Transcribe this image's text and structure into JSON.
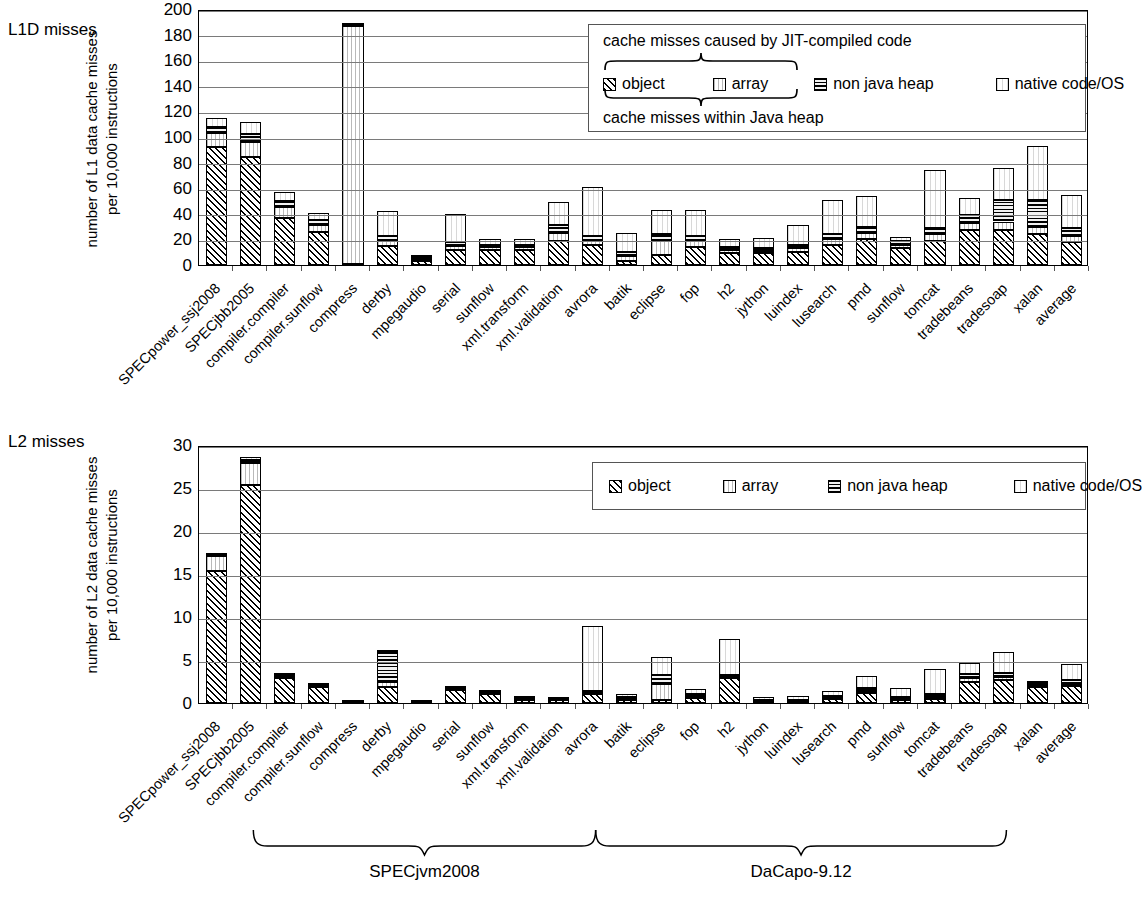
{
  "figure": {
    "panels": [
      {
        "side_title": "L1D misses",
        "ylabel_line1": "number of L1 data cache misses",
        "ylabel_line2": "per 10,000 instructions"
      },
      {
        "side_title": "L2 misses",
        "ylabel_line1": "number of L2 data cache misses",
        "ylabel_line2": "per 10,000 instructions"
      }
    ],
    "legend": {
      "top_caption": "cache misses caused by JIT-compiled code",
      "bottom_caption": "cache misses within Java heap",
      "entries": [
        {
          "label": "object",
          "swatch": "hatch-diagonal-swatch"
        },
        {
          "label": "array",
          "swatch": "vertical-light-swatch"
        },
        {
          "label": "non java heap",
          "swatch": "horizontal-dense-swatch"
        },
        {
          "label": "native code/OS",
          "swatch": "plain-light-swatch"
        }
      ]
    },
    "groups": [
      {
        "label": "SPECjvm2008",
        "start": 2,
        "end": 11
      },
      {
        "label": "DaCapo-9.12",
        "start": 12,
        "end": 23
      }
    ]
  },
  "chart_data": [
    {
      "type": "bar",
      "stacked": true,
      "title": "L1D misses",
      "xlabel": "",
      "ylabel": "number of L1 data cache misses per 10,000 instructions",
      "ylim": [
        0,
        200
      ],
      "yticks": [
        0,
        20,
        40,
        60,
        80,
        100,
        120,
        140,
        160,
        180,
        200
      ],
      "grid": true,
      "legend_position": "upper-right",
      "categories": [
        "SPECpower_ssj2008",
        "SPECjbb2005",
        "compiler.compiler",
        "compiler.sunflow",
        "compress",
        "derby",
        "mpegaudio",
        "serial",
        "sunflow",
        "xml.transform",
        "xml.validation",
        "avrora",
        "batik",
        "eclipse",
        "fop",
        "h2",
        "jython",
        "luindex",
        "lusearch",
        "pmd",
        "sunflow",
        "tomcat",
        "tradebeans",
        "tradesoap",
        "xalan",
        "average"
      ],
      "series": [
        {
          "name": "object",
          "values": [
            92,
            84,
            37,
            26,
            0.5,
            15,
            3,
            12,
            12,
            12,
            19,
            16,
            3,
            8,
            14,
            9,
            9,
            10,
            16,
            20,
            13,
            19,
            27,
            27,
            24,
            18
          ]
        },
        {
          "name": "array",
          "values": [
            11,
            12,
            8,
            5,
            186,
            4,
            2,
            3,
            2,
            2,
            6,
            3,
            4,
            11,
            5,
            3,
            2,
            3,
            4,
            5,
            3,
            5,
            6,
            7,
            6,
            5
          ]
        },
        {
          "name": "non java heap",
          "values": [
            5,
            6,
            5,
            4,
            1,
            4,
            1,
            3,
            2,
            2,
            6,
            4,
            3,
            5,
            4,
            2,
            2,
            3,
            4,
            5,
            3,
            5,
            6,
            17,
            21,
            6
          ]
        },
        {
          "name": "native code/OS",
          "values": [
            7,
            10,
            7,
            6,
            0.5,
            19,
            1,
            22,
            4,
            4,
            18,
            38,
            15,
            19,
            20,
            6,
            8,
            15,
            27,
            24,
            3,
            45,
            13,
            25,
            42,
            26
          ]
        }
      ]
    },
    {
      "type": "bar",
      "stacked": true,
      "title": "L2 misses",
      "xlabel": "",
      "ylabel": "number of L2 data cache misses per 10,000 instructions",
      "ylim": [
        0,
        30
      ],
      "yticks": [
        0,
        5,
        10,
        15,
        20,
        25,
        30
      ],
      "grid": true,
      "legend_position": "upper-right",
      "categories": [
        "SPECpower_ssj2008",
        "SPECjbb2005",
        "compiler.compiler",
        "compiler.sunflow",
        "compress",
        "derby",
        "mpegaudio",
        "serial",
        "sunflow",
        "xml.transform",
        "xml.validation",
        "avrora",
        "batik",
        "eclipse",
        "fop",
        "h2",
        "jython",
        "luindex",
        "lusearch",
        "pmd",
        "sunflow",
        "tomcat",
        "tradebeans",
        "tradesoap",
        "xalan",
        "average"
      ],
      "series": [
        {
          "name": "object",
          "values": [
            15.4,
            25.3,
            2.9,
            1.9,
            0.05,
            1.9,
            0.05,
            1.5,
            1.0,
            0.35,
            0.3,
            1.1,
            0.35,
            0.4,
            0.6,
            2.9,
            0.15,
            0.2,
            0.5,
            1.2,
            0.4,
            0.5,
            2.5,
            2.7,
            1.9,
            2.0
          ]
        },
        {
          "name": "array",
          "values": [
            1.7,
            2.6,
            0.15,
            0.1,
            0.03,
            0.5,
            0.02,
            0.1,
            0.1,
            0.08,
            0.1,
            0.1,
            0.15,
            1.8,
            0.2,
            0.15,
            0.1,
            0.1,
            0.15,
            0.25,
            0.15,
            0.2,
            0.4,
            0.3,
            0.15,
            0.25
          ]
        },
        {
          "name": "non java heap",
          "values": [
            0.15,
            0.35,
            0.2,
            0.1,
            0.02,
            3.5,
            0.03,
            0.15,
            0.15,
            0.1,
            0.1,
            0.2,
            0.2,
            1.1,
            0.2,
            0.2,
            0.1,
            0.1,
            0.15,
            0.35,
            0.2,
            0.3,
            0.5,
            0.5,
            0.25,
            0.45
          ]
        },
        {
          "name": "native code/OS",
          "values": [
            0.25,
            0.35,
            0.15,
            0.1,
            0.05,
            0.3,
            0.05,
            0.15,
            0.15,
            0.1,
            0.1,
            7.5,
            0.4,
            2.0,
            0.65,
            4.2,
            0.35,
            0.4,
            0.6,
            1.3,
            1.0,
            3.0,
            1.2,
            2.4,
            0.2,
            1.8
          ]
        }
      ]
    }
  ]
}
